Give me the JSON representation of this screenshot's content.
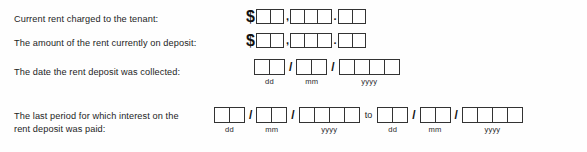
{
  "document": {
    "type": "rental-form-fragment",
    "background_color": "#fefefe",
    "ink_color": "#1d1d1d"
  },
  "rows": {
    "rent_charged": {
      "label": "Current rent charged to the tenant:",
      "currency_symbol": "$",
      "thousands_separator": ",",
      "decimal_separator": ".",
      "thousands_boxes": 2,
      "hundreds_boxes": 3,
      "cents_boxes": 2
    },
    "rent_deposit": {
      "label": "The amount of the rent currently on deposit:",
      "currency_symbol": "$",
      "thousands_separator": ",",
      "decimal_separator": ".",
      "thousands_boxes": 2,
      "hundreds_boxes": 3,
      "cents_boxes": 2
    },
    "date_collected": {
      "label": "The date the rent deposit was collected:",
      "date_separator": "/",
      "day_label": "dd",
      "month_label": "mm",
      "year_label": "yyyy",
      "day_boxes": 2,
      "month_boxes": 2,
      "year_boxes": 4
    },
    "interest_period": {
      "label": "The last period for which interest on the\nrent deposit was paid:",
      "range_separator": "to",
      "date_separator": "/",
      "from": {
        "day_label": "dd",
        "month_label": "mm",
        "year_label": "yyyy",
        "day_boxes": 2,
        "month_boxes": 2,
        "year_boxes": 4
      },
      "to": {
        "day_label": "dd",
        "month_label": "mm",
        "year_label": "yyyy",
        "day_boxes": 2,
        "month_boxes": 2,
        "year_boxes": 4
      }
    }
  }
}
